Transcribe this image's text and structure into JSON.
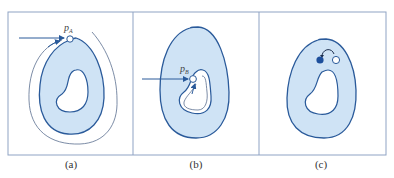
{
  "figure": {
    "panels": [
      {
        "id": "a",
        "caption": "(a)",
        "point_label": "p",
        "point_sub": "A"
      },
      {
        "id": "b",
        "caption": "(b)",
        "point_label": "p",
        "point_sub": "B"
      },
      {
        "id": "c",
        "caption": "(c)"
      }
    ],
    "colors": {
      "frame": "#8fa3c4",
      "region_fill": "#cfe3f5",
      "region_stroke": "#2a5a9a",
      "arrow": "#2a5a9a",
      "path_line": "#5a6f8f",
      "filled_dot": "#1d4f9c",
      "hollow_dot": "#ffffff"
    }
  }
}
